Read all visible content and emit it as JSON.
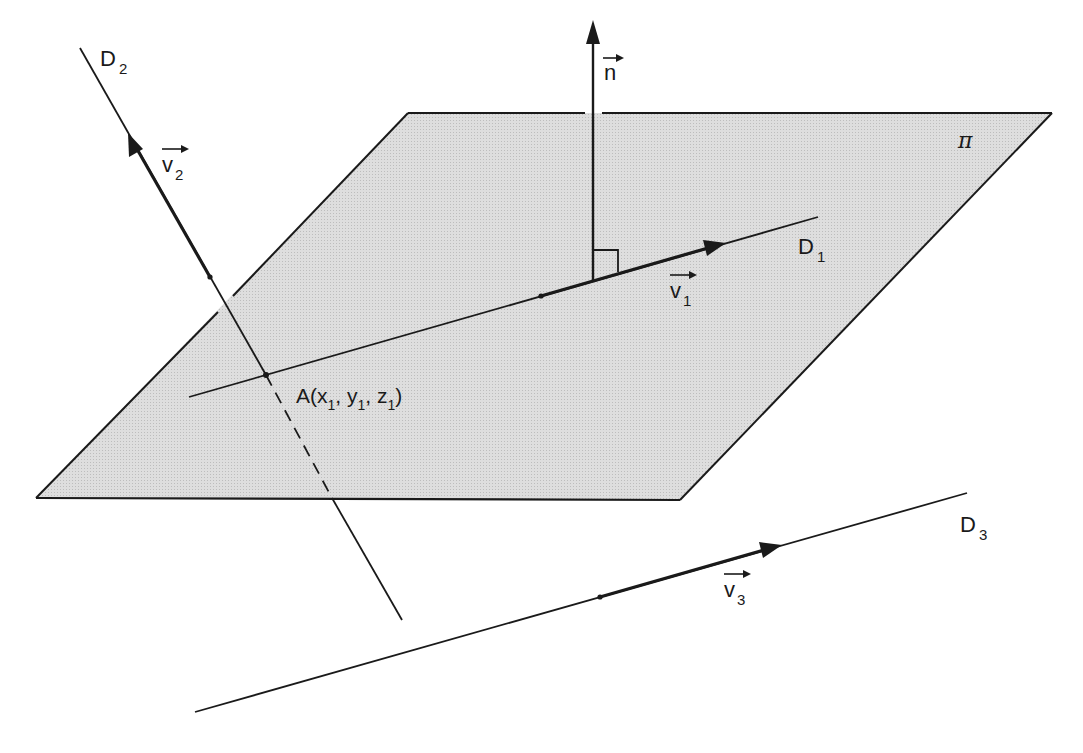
{
  "diagram": {
    "colors": {
      "plane_fill": "#dcdcdc",
      "stroke": "#1a1a1a",
      "background": "#ffffff"
    },
    "plane": {
      "label": "π",
      "corners": [
        [
          408,
          113
        ],
        [
          1052,
          113
        ],
        [
          680,
          500
        ],
        [
          36,
          498
        ]
      ]
    },
    "normal": {
      "label": "n",
      "from": [
        593,
        280
      ],
      "to": [
        593,
        20
      ]
    },
    "lines": [
      {
        "id": "D1",
        "label": "D",
        "subscript": "1",
        "vector_label": "v",
        "vector_subscript": "1",
        "from": [
          189,
          397
        ],
        "to": [
          818,
          217
        ],
        "vector_from": [
          541,
          296
        ],
        "vector_to": [
          726,
          243
        ]
      },
      {
        "id": "D2",
        "label": "D",
        "subscript": "2",
        "vector_label": "v",
        "vector_subscript": "2",
        "from": [
          80,
          48
        ],
        "to": [
          402,
          620
        ],
        "vector_from": [
          210,
          277
        ],
        "vector_to": [
          128,
          133
        ]
      },
      {
        "id": "D3",
        "label": "D",
        "subscript": "3",
        "vector_label": "v",
        "vector_subscript": "3",
        "from": [
          195,
          712
        ],
        "to": [
          967,
          493
        ],
        "vector_from": [
          600,
          597
        ],
        "vector_to": [
          782,
          545
        ]
      }
    ],
    "point_a": {
      "name": "A",
      "coords_text": [
        "x",
        "1",
        ", y",
        "1",
        ", z",
        "1"
      ],
      "position": [
        266,
        375
      ]
    }
  }
}
